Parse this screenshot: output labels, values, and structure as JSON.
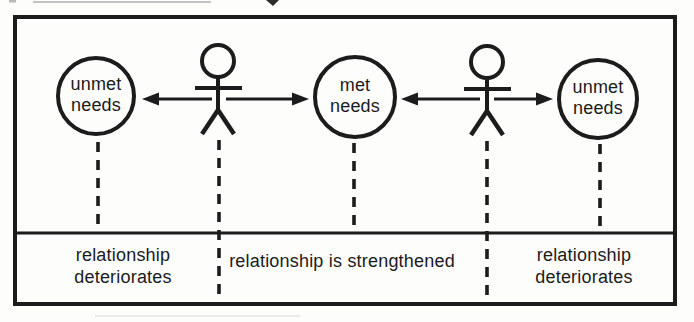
{
  "colors": {
    "ink": "#1c1c1c",
    "paper": "#fdfdfc",
    "artifact_gray": "#c4c4c4"
  },
  "diagram": {
    "nodes": {
      "left_circle": "unmet\nneeds",
      "center_circle": "met\nneeds",
      "right_circle": "unmet\nneeds"
    },
    "outcomes": {
      "left": "relationship\ndeteriorates",
      "center": "relationship is strengthened",
      "right": "relationship\ndeteriorates"
    },
    "icons": {
      "left_person": "person-icon",
      "right_person": "person-icon",
      "arrows": "double-headed-arrow-icon",
      "connectors": "dashed-connector-line"
    }
  }
}
